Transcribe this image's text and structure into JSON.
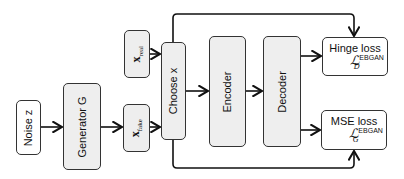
{
  "diagram": {
    "nodes": {
      "noise": {
        "label": "Noise z"
      },
      "generator": {
        "label": "Generator G"
      },
      "x_real": {
        "base": "x",
        "sub": "real"
      },
      "x_fake": {
        "base": "x",
        "sub": "fake"
      },
      "choose": {
        "label": "Choose x"
      },
      "encoder": {
        "label": "Encoder"
      },
      "decoder": {
        "label": "Decoder"
      },
      "hinge": {
        "label": "Hinge loss",
        "symbol": "ℒ",
        "sup": "EBGAN",
        "sub": "D"
      },
      "mse": {
        "label": "MSE loss",
        "symbol": "ℒ",
        "sup": "EBGAN",
        "sub": "G"
      }
    },
    "edges": [
      [
        "noise",
        "generator"
      ],
      [
        "generator",
        "x_fake"
      ],
      [
        "x_fake",
        "choose"
      ],
      [
        "x_real",
        "choose"
      ],
      [
        "choose",
        "encoder"
      ],
      [
        "encoder",
        "decoder"
      ],
      [
        "decoder",
        "hinge"
      ],
      [
        "decoder",
        "mse"
      ],
      [
        "choose",
        "hinge"
      ],
      [
        "choose",
        "mse"
      ]
    ]
  }
}
